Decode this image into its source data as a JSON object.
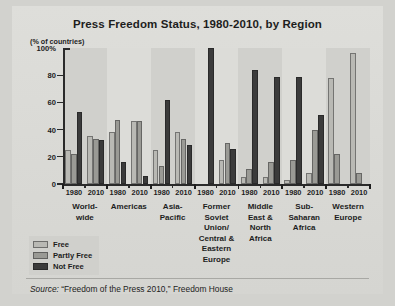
{
  "chart_data": {
    "type": "bar",
    "title": "Press Freedom Status, 1980-2010, by Region",
    "ylabel": "(% of countries)",
    "xlabel": "",
    "ylim": [
      0,
      100
    ],
    "yticks": [
      "0",
      "20",
      "40",
      "60",
      "80",
      "100%"
    ],
    "ytick_values": [
      0,
      20,
      40,
      60,
      80,
      100
    ],
    "grid": false,
    "legend_position": "below-left",
    "categories": [
      "World-wide 1980",
      "World-wide 2010",
      "Americas 1980",
      "Americas 2010",
      "Asia-Pacific 1980",
      "Asia-Pacific 2010",
      "Former Soviet Union/Central & Eastern Europe 1980",
      "Former Soviet Union/Central & Eastern Europe 2010",
      "Middle East & North Africa 1980",
      "Middle East & North Africa 2010",
      "Sub-Saharan Africa 1980",
      "Sub-Saharan Africa 2010",
      "Western Europe 1980",
      "Western Europe 2010"
    ],
    "series": [
      {
        "name": "Free",
        "color": "#b9b9b4",
        "values": [
          25,
          35,
          38,
          46,
          25,
          38,
          0,
          18,
          5,
          5,
          3,
          8,
          78,
          96
        ]
      },
      {
        "name": "Partly Free",
        "color": "#9a9a95",
        "values": [
          22,
          33,
          47,
          46,
          13,
          33,
          0,
          30,
          11,
          16,
          18,
          40,
          22,
          8
        ]
      },
      {
        "name": "Not Free",
        "color": "#3b3b3b",
        "values": [
          53,
          32,
          16,
          6,
          62,
          29,
          100,
          26,
          84,
          79,
          79,
          51,
          0,
          0
        ]
      }
    ],
    "groups": [
      {
        "label": "World-\nwide",
        "lines": [
          "World-",
          "wide"
        ],
        "years": [
          "1980",
          "2010"
        ]
      },
      {
        "label": "Americas",
        "lines": [
          "Americas"
        ],
        "years": [
          "1980",
          "2010"
        ]
      },
      {
        "label": "Asia-\nPacific",
        "lines": [
          "Asia-",
          "Pacific"
        ],
        "years": [
          "1980",
          "2010"
        ]
      },
      {
        "label": "Former Soviet Union/ Central & Eastern Europe",
        "lines": [
          "Former",
          "Soviet",
          "Union/",
          "Central &",
          "Eastern",
          "Europe"
        ],
        "years": [
          "1980",
          "2010"
        ]
      },
      {
        "label": "Middle East & North Africa",
        "lines": [
          "Middle",
          "East &",
          "North",
          "Africa"
        ],
        "years": [
          "1980",
          "2010"
        ]
      },
      {
        "label": "Sub-Saharan Africa",
        "lines": [
          "Sub-",
          "Saharan",
          "Africa"
        ],
        "years": [
          "1980",
          "2010"
        ]
      },
      {
        "label": "Western Europe",
        "lines": [
          "Western",
          "Europe"
        ],
        "years": [
          "1980",
          "2010"
        ]
      }
    ],
    "source": "Source: “Freedom of the Press 2010,” Freedom House",
    "source_prefix": "Source:",
    "source_text": " “Freedom of the Press 2010,” Freedom House"
  },
  "legend": {
    "items": [
      {
        "label": "Free",
        "color": "#b9b9b4"
      },
      {
        "label": "Partly Free",
        "color": "#9a9a95"
      },
      {
        "label": "Not Free",
        "color": "#3b3b3b"
      }
    ]
  },
  "colors": {
    "paper": "#dcdcd8",
    "band": "#d0d0cc",
    "axis": "#2a2a2a",
    "text": "#1d1d1d"
  }
}
